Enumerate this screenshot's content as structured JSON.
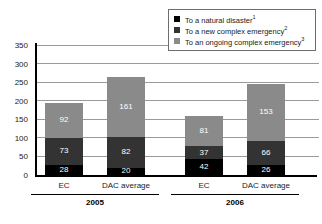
{
  "chart_data": {
    "type": "bar",
    "subtype": "stacked",
    "title": "",
    "xlabel": "",
    "ylabel": "",
    "ylim": [
      0,
      350
    ],
    "yticks": [
      0,
      50,
      100,
      150,
      200,
      250,
      300,
      350
    ],
    "grid": true,
    "legend_position": "top-right",
    "categories": [
      "EC",
      "DAC average",
      "EC",
      "DAC average"
    ],
    "groups": [
      {
        "label": "2005",
        "categories": [
          "EC",
          "DAC average"
        ]
      },
      {
        "label": "2006",
        "categories": [
          "EC",
          "DAC average"
        ]
      }
    ],
    "series": [
      {
        "name": "To a natural disaster",
        "footnote": "1",
        "color": "#000000",
        "values": [
          28,
          20,
          42,
          26
        ]
      },
      {
        "name": "To a new complex emergency",
        "footnote": "2",
        "color": "#333333",
        "values": [
          73,
          82,
          37,
          66
        ]
      },
      {
        "name": "To an ongoing complex emergency",
        "footnote": "3",
        "color": "#8a8a8a",
        "values": [
          92,
          161,
          81,
          153
        ]
      }
    ],
    "totals": [
      193,
      263,
      160,
      245
    ]
  },
  "legend": {
    "items": [
      {
        "label": "To a natural disaster",
        "sup": "1"
      },
      {
        "label": "To a new complex emergency",
        "sup": "2"
      },
      {
        "label": "To an ongoing complex emergency",
        "sup": "3"
      }
    ]
  },
  "axis": {
    "yticks": [
      "350",
      "300",
      "250",
      "200",
      "150",
      "100",
      "50",
      "0"
    ]
  },
  "bars": [
    {
      "category": "EC",
      "group": "2005",
      "natural": "28",
      "new": "73",
      "ongoing": "92"
    },
    {
      "category": "DAC average",
      "group": "2005",
      "natural": "20",
      "new": "82",
      "ongoing": "161"
    },
    {
      "category": "EC",
      "group": "2006",
      "natural": "42",
      "new": "37",
      "ongoing": "81"
    },
    {
      "category": "DAC average",
      "group": "2006",
      "natural": "26",
      "new": "66",
      "ongoing": "153"
    }
  ],
  "groups": [
    {
      "label": "2005"
    },
    {
      "label": "2006"
    }
  ],
  "colors": {
    "natural_disaster": "#000000",
    "new_complex_emergency": "#333333",
    "ongoing_complex_emergency": "#8a8a8a",
    "gridline": "#9a9a9a",
    "axis": "#000000"
  }
}
